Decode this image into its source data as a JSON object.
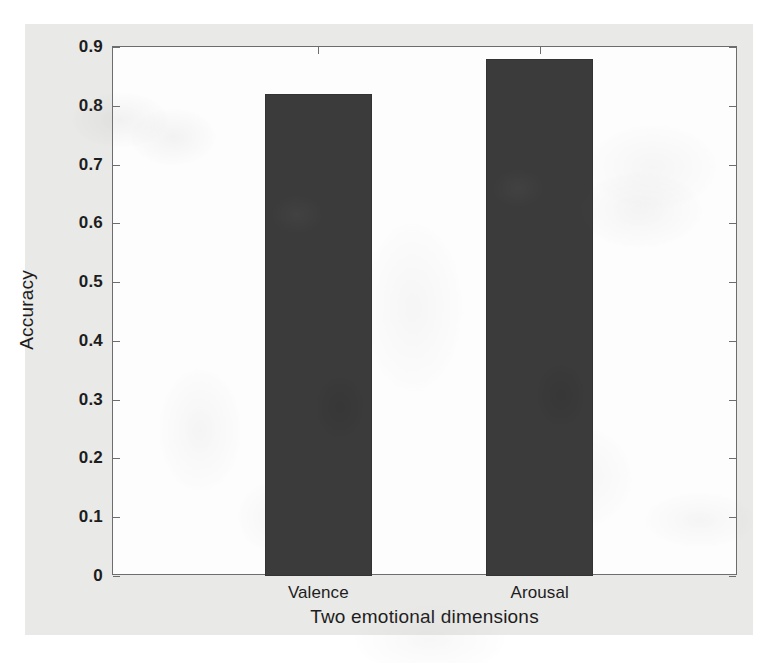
{
  "chart_data": {
    "type": "bar",
    "title": "",
    "categories": [
      "Valence",
      "Arousal"
    ],
    "values": [
      0.82,
      0.88
    ],
    "xlabel": "Two emotional dimensions",
    "ylabel": "Accuracy",
    "ylim": [
      0,
      0.9
    ],
    "yticks": [
      "0",
      "0.1",
      "0.2",
      "0.3",
      "0.4",
      "0.5",
      "0.6",
      "0.7",
      "0.8",
      "0.9"
    ],
    "ytick_values": [
      0,
      0.1,
      0.2,
      0.3,
      0.4,
      0.5,
      0.6,
      0.7,
      0.8,
      0.9
    ],
    "grid": false,
    "legend": null,
    "bar_color": "#3b3b3b",
    "plot_background": "#fdfdfd",
    "figure_background": "#e9e9e7",
    "axis_color": "#6d6d6d"
  },
  "axes": {
    "x_title": "Two emotional dimensions",
    "y_title": "Accuracy"
  }
}
